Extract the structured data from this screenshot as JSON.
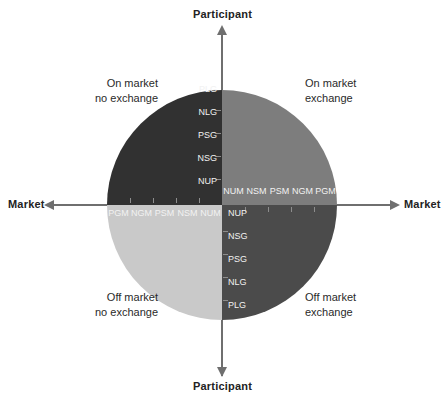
{
  "diagram": {
    "center": {
      "x": 222,
      "y": 205
    },
    "radius": 115,
    "colors": {
      "quadrant_top_left": "#313131",
      "quadrant_top_right": "#7d7d7d",
      "quadrant_bottom_left": "#c9c9c9",
      "quadrant_bottom_right": "#4b4b4b",
      "axis": "#6f6f6f",
      "axis_text": "#232323",
      "tick_text": "#f2f2f2",
      "caption_text": "#2a2a2a",
      "background": "#ffffff"
    }
  },
  "axes": {
    "top_label": "Participant",
    "bottom_label": "Participant",
    "left_label": "Market",
    "right_label": "Market"
  },
  "quadrant_captions": {
    "top_left": {
      "line1": "On market",
      "line2": "no exchange"
    },
    "top_right": {
      "line1": "On market",
      "line2": "exchange"
    },
    "bottom_left": {
      "line1": "Off market",
      "line2": "no exchange"
    },
    "bottom_right": {
      "line1": "Off market",
      "line2": "exchange"
    }
  },
  "tick_labels": {
    "top_left_vertical": [
      "PLG",
      "NLG",
      "PSG",
      "NSG",
      "NUP"
    ],
    "bottom_right_vertical": [
      "NUP",
      "NSG",
      "PSG",
      "NLG",
      "PLG"
    ],
    "left_horizontal": [
      "PGM",
      "NGM",
      "PSM",
      "NSM",
      "NUM"
    ],
    "right_horizontal": [
      "NUM",
      "NSM",
      "PSM",
      "NGM",
      "PGM"
    ]
  }
}
